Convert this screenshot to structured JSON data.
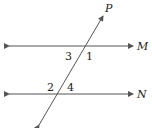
{
  "diagram": {
    "lines": [
      {
        "name": "M",
        "label": "M"
      },
      {
        "name": "N",
        "label": "N"
      },
      {
        "name": "P",
        "label": "P"
      }
    ],
    "angles": [
      "1",
      "2",
      "3",
      "4"
    ],
    "colors": {
      "stroke": "#555555",
      "text": "#222222"
    }
  }
}
